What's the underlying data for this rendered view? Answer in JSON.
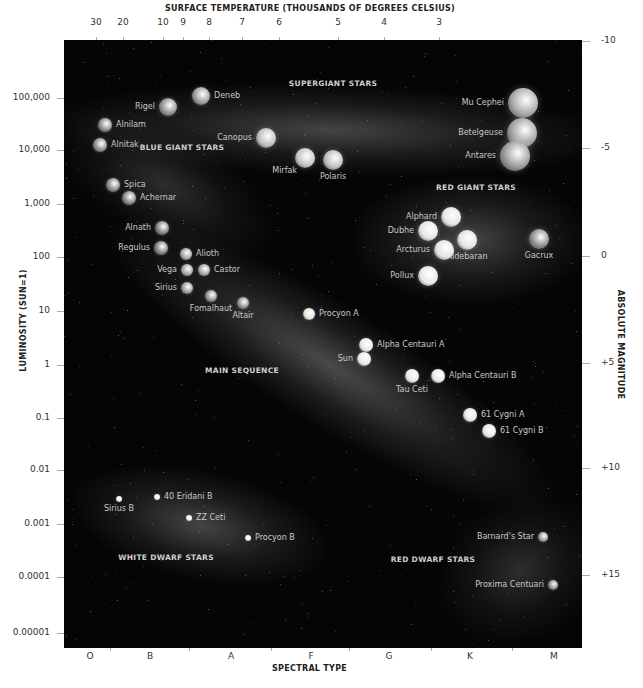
{
  "chart_data": {
    "type": "scatter",
    "top_axis": {
      "label": "SURFACE TEMPERATURE (THOUSANDS OF DEGREES CELSIUS)",
      "ticks": [
        {
          "label": "30",
          "x": 96
        },
        {
          "label": "20",
          "x": 123
        },
        {
          "label": "10",
          "x": 163
        },
        {
          "label": "9",
          "x": 183
        },
        {
          "label": "8",
          "x": 209
        },
        {
          "label": "7",
          "x": 242
        },
        {
          "label": "6",
          "x": 279
        },
        {
          "label": "5",
          "x": 338
        },
        {
          "label": "4",
          "x": 384
        },
        {
          "label": "3",
          "x": 439
        }
      ]
    },
    "left_axis": {
      "label": "LUMINOSITY (SUN=1)",
      "scale": "log",
      "ticks": [
        {
          "label": "100,000",
          "y": 98
        },
        {
          "label": "10,000",
          "y": 150
        },
        {
          "label": "1,000",
          "y": 204
        },
        {
          "label": "100",
          "y": 257
        },
        {
          "label": "10",
          "y": 311
        },
        {
          "label": "1",
          "y": 365
        },
        {
          "label": "0.1",
          "y": 418
        },
        {
          "label": "0.01",
          "y": 470
        },
        {
          "label": "0.001",
          "y": 524
        },
        {
          "label": "0.0001",
          "y": 577
        },
        {
          "label": "0.00001",
          "y": 633
        }
      ]
    },
    "right_axis": {
      "label": "ABSOLUTE MAGNITUDE",
      "ticks": [
        {
          "label": "-10",
          "y": 41
        },
        {
          "label": "-5",
          "y": 148
        },
        {
          "label": "0",
          "y": 256
        },
        {
          "label": "+5",
          "y": 363
        },
        {
          "label": "+10",
          "y": 468
        },
        {
          "label": "+15",
          "y": 575
        }
      ]
    },
    "bottom_axis": {
      "label": "SPECTRAL TYPE",
      "categories": [
        {
          "label": "O",
          "x": 90
        },
        {
          "label": "B",
          "x": 150
        },
        {
          "label": "A",
          "x": 231
        },
        {
          "label": "F",
          "x": 311
        },
        {
          "label": "G",
          "x": 389
        },
        {
          "label": "K",
          "x": 470
        },
        {
          "label": "M",
          "x": 554
        }
      ],
      "dividers": [
        110,
        189,
        271,
        349,
        431,
        512
      ]
    },
    "regions": [
      {
        "name": "SUPERGIANT STARS",
        "x": 333,
        "y": 83
      },
      {
        "name": "BLUE GIANT STARS",
        "x": 182,
        "y": 147
      },
      {
        "name": "RED GIANT STARS",
        "x": 476,
        "y": 187
      },
      {
        "name": "MAIN SEQUENCE",
        "x": 242,
        "y": 370
      },
      {
        "name": "WHITE DWARF STARS",
        "x": 166,
        "y": 557
      },
      {
        "name": "RED DWARF STARS",
        "x": 433,
        "y": 559
      }
    ],
    "stars": [
      {
        "name": "Deneb",
        "x": 201,
        "y": 96,
        "r": 9,
        "color": "#9a9a9a",
        "label_side": "right",
        "luminosity": "~100,000"
      },
      {
        "name": "Rigel",
        "x": 168,
        "y": 107,
        "r": 9,
        "color": "#8e8e8e",
        "label_side": "left",
        "luminosity": "~60,000"
      },
      {
        "name": "Alnilam",
        "x": 105,
        "y": 125,
        "r": 7,
        "color": "#8a8a8a",
        "label_side": "right",
        "luminosity": "~30,000"
      },
      {
        "name": "Alnitak",
        "x": 100,
        "y": 145,
        "r": 7,
        "color": "#8a8a8a",
        "label_side": "right",
        "luminosity": "~15,000"
      },
      {
        "name": "Canopus",
        "x": 266,
        "y": 138,
        "r": 10,
        "color": "#bdbdbd",
        "label_side": "left",
        "luminosity": "~15,000"
      },
      {
        "name": "Mirfak",
        "x": 305,
        "y": 158,
        "r": 10,
        "color": "#c4c4c4",
        "label_side": "left-below",
        "luminosity": "~5,000"
      },
      {
        "name": "Polaris",
        "x": 333,
        "y": 160,
        "r": 10,
        "color": "#bdbdbd",
        "label_side": "below",
        "luminosity": "~2,500"
      },
      {
        "name": "Mu Cephei",
        "x": 523,
        "y": 103,
        "r": 15,
        "color": "#a8a8a8",
        "label_side": "left",
        "luminosity": "~100,000"
      },
      {
        "name": "Betelgeuse",
        "x": 522,
        "y": 133,
        "r": 15,
        "color": "#a0a0a0",
        "label_side": "left",
        "luminosity": "~20,000"
      },
      {
        "name": "Antares",
        "x": 515,
        "y": 156,
        "r": 15,
        "color": "#9a9a9a",
        "label_side": "left",
        "luminosity": "~10,000"
      },
      {
        "name": "Spica",
        "x": 113,
        "y": 185,
        "r": 7,
        "color": "#858585",
        "label_side": "right",
        "luminosity": "~2,000"
      },
      {
        "name": "Achernar",
        "x": 129,
        "y": 198,
        "r": 7,
        "color": "#858585",
        "label_side": "right",
        "luminosity": "~1,200"
      },
      {
        "name": "Alnath",
        "x": 162,
        "y": 228,
        "r": 7,
        "color": "#7e7e7e",
        "label_side": "left",
        "luminosity": "~400"
      },
      {
        "name": "Regulus",
        "x": 161,
        "y": 248,
        "r": 7,
        "color": "#7e7e7e",
        "label_side": "left",
        "luminosity": "~150"
      },
      {
        "name": "Alioth",
        "x": 186,
        "y": 254,
        "r": 6,
        "color": "#a5a5a5",
        "label_side": "right",
        "luminosity": "~100"
      },
      {
        "name": "Vega",
        "x": 187,
        "y": 270,
        "r": 6,
        "color": "#a5a5a5",
        "label_side": "left",
        "luminosity": "~50"
      },
      {
        "name": "Castor",
        "x": 204,
        "y": 270,
        "r": 6,
        "color": "#a5a5a5",
        "label_side": "right",
        "luminosity": "~50"
      },
      {
        "name": "Sirius",
        "x": 187,
        "y": 288,
        "r": 6,
        "color": "#9a9a9a",
        "label_side": "left",
        "luminosity": "~25"
      },
      {
        "name": "Fomalhaut",
        "x": 211,
        "y": 296,
        "r": 6,
        "color": "#8f8f8f",
        "label_side": "below",
        "luminosity": "~17"
      },
      {
        "name": "Altair",
        "x": 243,
        "y": 303,
        "r": 6,
        "color": "#8f8f8f",
        "label_side": "below",
        "luminosity": "~11"
      },
      {
        "name": "Alphard",
        "x": 451,
        "y": 217,
        "r": 10,
        "color": "#e4e4e4",
        "label_side": "left",
        "luminosity": "~400"
      },
      {
        "name": "Dubhe",
        "x": 428,
        "y": 231,
        "r": 10,
        "color": "#e4e4e4",
        "label_side": "left",
        "luminosity": "~300"
      },
      {
        "name": "Aldebaran",
        "x": 467,
        "y": 240,
        "r": 10,
        "color": "#e4e4e4",
        "label_side": "below",
        "luminosity": "~150"
      },
      {
        "name": "Arcturus",
        "x": 444,
        "y": 250,
        "r": 10,
        "color": "#e4e4e4",
        "label_side": "left",
        "luminosity": "~110"
      },
      {
        "name": "Gacrux",
        "x": 539,
        "y": 239,
        "r": 10,
        "color": "#8a8a8a",
        "label_side": "below",
        "luminosity": "~150"
      },
      {
        "name": "Pollux",
        "x": 428,
        "y": 276,
        "r": 10,
        "color": "#e8e8e8",
        "label_side": "left",
        "luminosity": "~40"
      },
      {
        "name": "Procyon A",
        "x": 309,
        "y": 314,
        "r": 6,
        "color": "#e3e3e3",
        "label_side": "right",
        "luminosity": "~7"
      },
      {
        "name": "Alpha Centauri A",
        "x": 366,
        "y": 345,
        "r": 7,
        "color": "#e8e8e8",
        "label_side": "right",
        "luminosity": "~1.5"
      },
      {
        "name": "Sun",
        "x": 364,
        "y": 359,
        "r": 7,
        "color": "#e8e8e8",
        "label_side": "left",
        "luminosity": "1"
      },
      {
        "name": "Tau Ceti",
        "x": 412,
        "y": 376,
        "r": 7,
        "color": "#e8e8e8",
        "label_side": "below",
        "luminosity": "~0.5"
      },
      {
        "name": "Alpha Centauri B",
        "x": 438,
        "y": 376,
        "r": 7,
        "color": "#e8e8e8",
        "label_side": "right",
        "luminosity": "~0.5"
      },
      {
        "name": "61 Cygni A",
        "x": 470,
        "y": 415,
        "r": 7,
        "color": "#e8e8e8",
        "label_side": "right",
        "luminosity": "~0.15"
      },
      {
        "name": "61 Cygni B",
        "x": 489,
        "y": 431,
        "r": 7,
        "color": "#e8e8e8",
        "label_side": "right",
        "luminosity": "~0.08"
      },
      {
        "name": "Sirius B",
        "x": 119,
        "y": 499,
        "r": 3,
        "color": "#f0f0f0",
        "label_side": "below",
        "luminosity": "~0.003"
      },
      {
        "name": "40 Eridani B",
        "x": 157,
        "y": 497,
        "r": 3,
        "color": "#f0f0f0",
        "label_side": "right",
        "luminosity": "~0.003"
      },
      {
        "name": "ZZ Ceti",
        "x": 189,
        "y": 518,
        "r": 3,
        "color": "#f0f0f0",
        "label_side": "right",
        "luminosity": "~0.0012"
      },
      {
        "name": "Procyon B",
        "x": 248,
        "y": 538,
        "r": 3,
        "color": "#f0f0f0",
        "label_side": "right",
        "luminosity": "~0.0005"
      },
      {
        "name": "Barnard's Star",
        "x": 543,
        "y": 537,
        "r": 5,
        "color": "#9a9a9a",
        "label_side": "left",
        "luminosity": "~0.0005"
      },
      {
        "name": "Proxima Centuari",
        "x": 553,
        "y": 585,
        "r": 5,
        "color": "#8a8a8a",
        "label_side": "left",
        "luminosity": "~0.00006"
      }
    ],
    "grid": false,
    "legend": null
  }
}
